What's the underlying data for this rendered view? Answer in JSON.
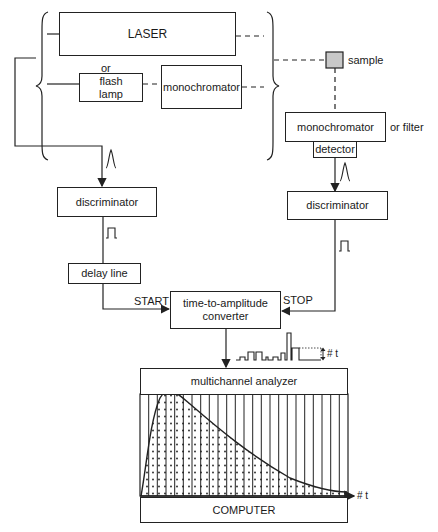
{
  "diagram": {
    "type": "block diagram",
    "boxes": {
      "laser": "LASER",
      "or_label": "or",
      "flash_lamp": "flash\nlamp",
      "monochromator_excitation": "monochromator",
      "sample": "sample",
      "monochromator_emission": "monochromator",
      "or_filter": "or filter",
      "detector": "detector",
      "discriminator_left": "discriminator",
      "discriminator_right": "discriminator",
      "delay_line": "delay line",
      "tac": "time-to-amplitude\nconverter",
      "mca": "multichannel analyzer",
      "computer": "COMPUTER"
    },
    "signals": {
      "start": "START",
      "stop": "STOP",
      "axis_label": "# t",
      "pulse_height_label": "# t"
    },
    "colors": {
      "line": "#222222",
      "sample_fill": "#c8c8c8",
      "background": "#ffffff"
    }
  },
  "histogram": {
    "bins": 24,
    "shape": "decay curve with fast rise and exponential tail",
    "x_label": "# t"
  }
}
